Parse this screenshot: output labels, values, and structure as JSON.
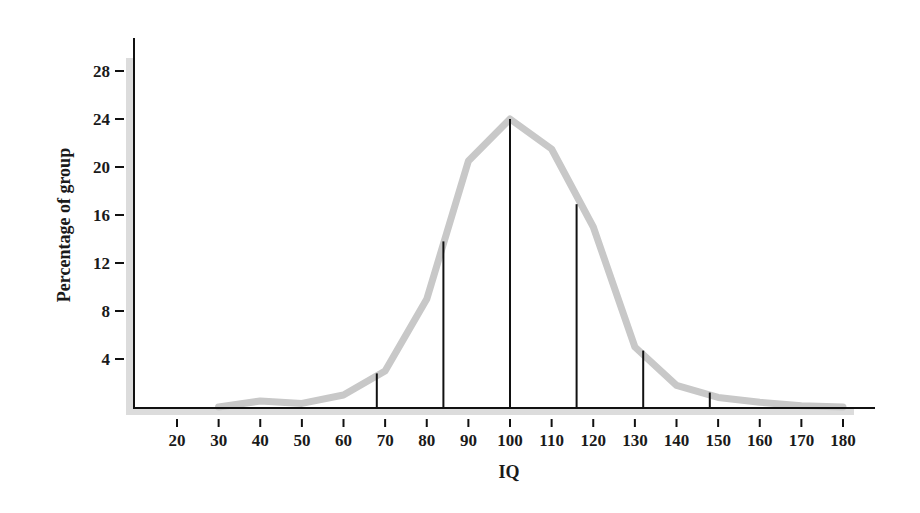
{
  "chart_data": {
    "type": "line",
    "title": "",
    "xlabel": "IQ",
    "ylabel": "Percentage of group",
    "xlim": [
      10,
      185
    ],
    "ylim": [
      0,
      30
    ],
    "grid": false,
    "legend": null,
    "x_ticks": [
      20,
      30,
      40,
      50,
      60,
      70,
      80,
      90,
      100,
      110,
      120,
      130,
      140,
      150,
      160,
      170,
      180
    ],
    "y_ticks": [
      4,
      8,
      12,
      16,
      20,
      24,
      28
    ],
    "series": [
      {
        "name": "IQ distribution curve",
        "style": "thick light-gray line",
        "color": "#c8c8c8",
        "x": [
          30,
          40,
          50,
          60,
          70,
          80,
          90,
          100,
          110,
          120,
          130,
          140,
          150,
          160,
          170,
          180
        ],
        "values": [
          0,
          0.5,
          0.3,
          1.0,
          3.0,
          9.0,
          20.5,
          24.0,
          21.5,
          15.0,
          5.0,
          1.8,
          0.8,
          0.4,
          0.1,
          0
        ]
      }
    ],
    "annotations": {
      "description": "Vertical black lines marking standard-deviation points (mean 100, SD 16)",
      "color": "#111111",
      "lines": [
        {
          "x": 68,
          "height": 2.8
        },
        {
          "x": 84,
          "height": 13.8
        },
        {
          "x": 100,
          "height": 24.0
        },
        {
          "x": 116,
          "height": 16.9
        },
        {
          "x": 132,
          "height": 4.7
        },
        {
          "x": 148,
          "height": 1.2
        }
      ]
    }
  }
}
